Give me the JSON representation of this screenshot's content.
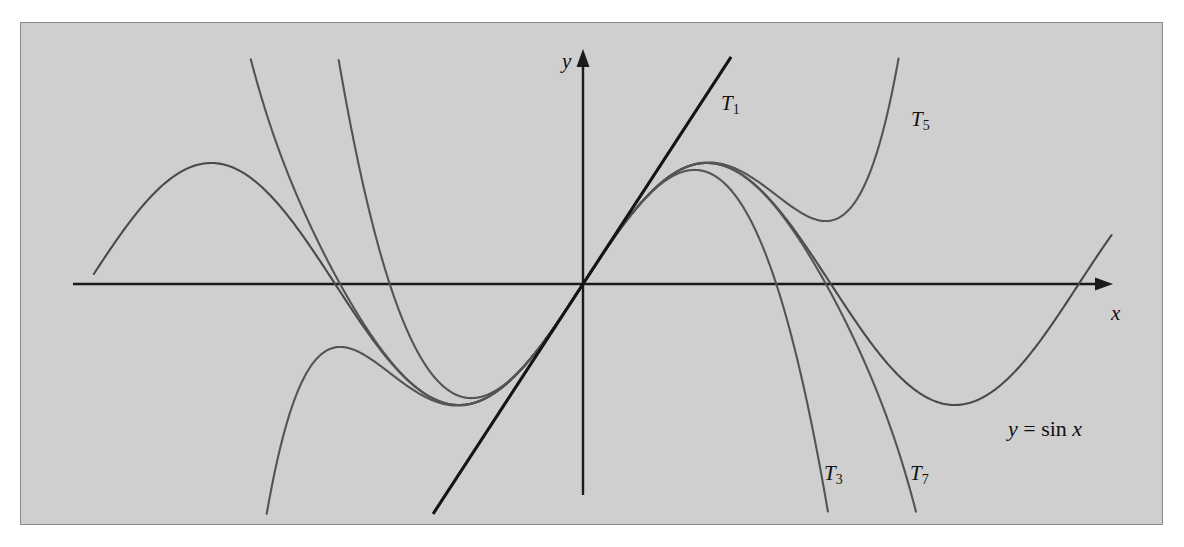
{
  "figure": {
    "caption_text": "",
    "background_color": "#cfcfcf",
    "border_color": "#8a8a8a"
  },
  "axes": {
    "x_label": "x",
    "y_label": "y",
    "origin_px": [
      562,
      261
    ],
    "x_unit_px": 78.9,
    "y_unit_px": 121.0,
    "x_range_units": [
      -6.95,
      6.95
    ],
    "y_range_units": [
      -1.78,
      1.76
    ]
  },
  "labels": {
    "t1": {
      "base": "T",
      "sub": "1"
    },
    "t3": {
      "base": "T",
      "sub": "3"
    },
    "t5": {
      "base": "T",
      "sub": "5"
    },
    "t7": {
      "base": "T",
      "sub": "7"
    },
    "sine": "y = sin x"
  },
  "chart_data": {
    "type": "line",
    "title": "",
    "subtitle": "",
    "xlabel": "x",
    "ylabel": "y",
    "xlim": [
      -6.95,
      6.95
    ],
    "ylim": [
      -1.78,
      1.76
    ],
    "grid": false,
    "legend": "inline-curve-labels",
    "annotations": [
      {
        "text": "T1",
        "x": 2.18,
        "y": 1.72
      },
      {
        "text": "T5",
        "x": 4.52,
        "y": 1.55
      },
      {
        "text": "T3",
        "x": 3.43,
        "y": -1.46
      },
      {
        "text": "T7",
        "x": 4.48,
        "y": -1.46
      },
      {
        "text": "y = sin x",
        "x": 5.6,
        "y": -1.17
      }
    ],
    "series": [
      {
        "name": "y = sin x",
        "expression": "sin(x)",
        "color": "#4a4a4a",
        "x_domain": [
          -6.2,
          6.7
        ],
        "samples_x": [
          -6.2,
          -5.5,
          -4.71,
          -3.93,
          -3.14,
          -2.36,
          -1.57,
          -0.79,
          0,
          0.79,
          1.57,
          2.36,
          3.14,
          3.93,
          4.71,
          5.5,
          6.28,
          6.7
        ],
        "samples_y": [
          0.083,
          0.706,
          1.0,
          0.707,
          -0.002,
          -0.707,
          -1.0,
          -0.71,
          0,
          0.71,
          1.0,
          0.707,
          -0.002,
          -0.707,
          -1.0,
          -0.706,
          -0.003,
          0.391
        ]
      },
      {
        "name": "T1",
        "expression": "x",
        "color": "#141414",
        "x_domain": [
          -1.9,
          2.2
        ],
        "samples_x": [
          -1.9,
          -0.95,
          0,
          0.95,
          2.2
        ],
        "samples_y": [
          -1.9,
          -0.95,
          0,
          0.95,
          2.2
        ]
      },
      {
        "name": "T3",
        "expression": "x - x^3/6",
        "color": "#545454",
        "x_domain": [
          -3.6,
          3.6
        ],
        "samples_x": [
          -3.6,
          -3.0,
          -2.4,
          -1.8,
          -1.2,
          -0.6,
          0,
          0.6,
          1.2,
          1.8,
          2.4,
          3.0,
          3.6
        ],
        "samples_y": [
          4.18,
          1.5,
          -0.096,
          -0.828,
          -0.912,
          -0.564,
          0,
          0.564,
          0.912,
          0.828,
          0.096,
          -1.5,
          -4.18
        ]
      },
      {
        "name": "T5",
        "expression": "x - x^3/6 + x^5/120",
        "color": "#545454",
        "x_domain": [
          -4.4,
          4.4
        ],
        "samples_x": [
          -4.4,
          -3.8,
          -3.2,
          -2.6,
          -2.0,
          -1.4,
          -0.8,
          0,
          0.8,
          1.4,
          2.0,
          2.6,
          3.2,
          3.8,
          4.4
        ],
        "samples_y": [
          -4.05,
          -1.87,
          -0.68,
          -0.42,
          -0.67,
          -0.99,
          -0.717,
          0,
          0.717,
          0.99,
          0.667,
          0.42,
          0.68,
          1.87,
          4.05
        ]
      },
      {
        "name": "T7",
        "expression": "x - x^3/6 + x^5/120 - x^7/5040",
        "color": "#545454",
        "x_domain": [
          -4.5,
          4.5
        ],
        "samples_x": [
          -4.5,
          -3.9,
          -3.3,
          -2.7,
          -2.1,
          -1.5,
          -0.9,
          0,
          0.9,
          1.5,
          2.1,
          2.7,
          3.3,
          3.9,
          4.5
        ],
        "samples_y": [
          1.36,
          0.0,
          -0.54,
          -0.51,
          -0.86,
          -0.997,
          -0.783,
          0,
          0.783,
          0.997,
          0.863,
          0.51,
          0.54,
          0.0,
          -1.36
        ]
      }
    ]
  }
}
